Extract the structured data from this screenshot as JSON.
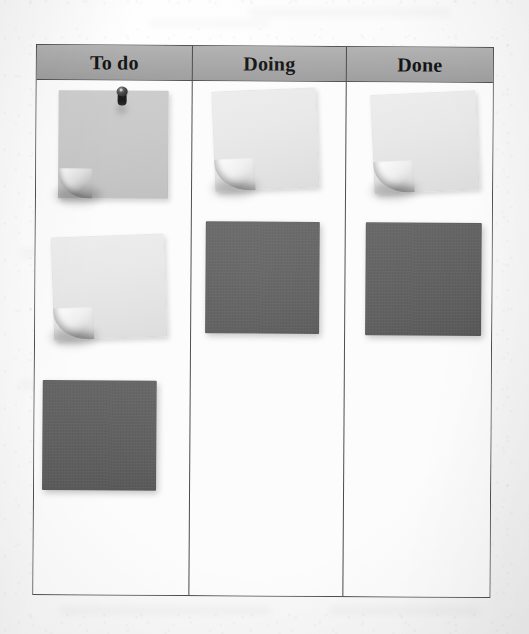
{
  "photo": {
    "subject": "kanban-board-on-paper",
    "background_color": "#fbfbfb"
  },
  "board": {
    "border_color": "#4e4e4e",
    "cell_background": "#fcfcfc",
    "header": {
      "background_color": "#a8a8a8",
      "text_color": "#141414",
      "columns": [
        {
          "label": "To do"
        },
        {
          "label": "Doing"
        },
        {
          "label": "Done"
        }
      ]
    },
    "columns": [
      {
        "id": "todo",
        "label": "To do",
        "card_count": 3,
        "cards": [
          {
            "id": "todo-1",
            "kind": "sticky-note",
            "text": "",
            "color": "#c8c8c8",
            "pinned": true,
            "pin_color": "#1c1c1c",
            "curled_corner": "bottom-left",
            "rotation_deg": 0
          },
          {
            "id": "todo-2",
            "kind": "sticky-note",
            "text": "",
            "color": "#e8e8e8",
            "pinned": false,
            "curled_corner": "bottom-left",
            "rotation_deg": -2.4
          },
          {
            "id": "todo-3",
            "kind": "card",
            "text": "",
            "color": "#5f5f5f",
            "pinned": false,
            "curled_corner": "none",
            "rotation_deg": 0
          }
        ]
      },
      {
        "id": "doing",
        "label": "Doing",
        "card_count": 2,
        "cards": [
          {
            "id": "doing-1",
            "kind": "sticky-note",
            "text": "",
            "color": "#e5e5e5",
            "pinned": false,
            "curled_corner": "bottom-left",
            "rotation_deg": -2.8
          },
          {
            "id": "doing-2",
            "kind": "card",
            "text": "",
            "color": "#5f5f5f",
            "pinned": false,
            "curled_corner": "none",
            "rotation_deg": 0
          }
        ]
      },
      {
        "id": "done",
        "label": "Done",
        "card_count": 2,
        "cards": [
          {
            "id": "done-1",
            "kind": "sticky-note",
            "text": "",
            "color": "#e5e5e5",
            "pinned": false,
            "curled_corner": "bottom-left",
            "rotation_deg": -3.0
          },
          {
            "id": "done-2",
            "kind": "card",
            "text": "",
            "color": "#5f5f5f",
            "pinned": false,
            "curled_corner": "none",
            "rotation_deg": 0
          }
        ]
      }
    ]
  }
}
